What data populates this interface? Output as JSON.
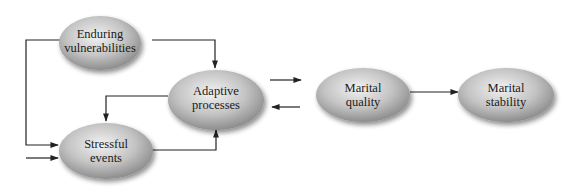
{
  "diagram": {
    "type": "flow-model",
    "nodes": [
      {
        "id": "enduring",
        "lines": [
          "Enduring",
          "vulnerabilities"
        ]
      },
      {
        "id": "adaptive",
        "lines": [
          "Adaptive",
          "processes"
        ]
      },
      {
        "id": "stressful",
        "lines": [
          "Stressful",
          "events"
        ]
      },
      {
        "id": "quality",
        "lines": [
          "Marital",
          "quality"
        ]
      },
      {
        "id": "stability",
        "lines": [
          "Marital",
          "stability"
        ]
      }
    ],
    "edges": [
      {
        "from": "enduring",
        "to": "adaptive"
      },
      {
        "from": "enduring",
        "to": "stressful"
      },
      {
        "from": "external",
        "to": "stressful"
      },
      {
        "from": "adaptive",
        "to": "stressful"
      },
      {
        "from": "stressful",
        "to": "adaptive"
      },
      {
        "from": "adaptive",
        "to": "quality"
      },
      {
        "from": "quality",
        "to": "adaptive"
      },
      {
        "from": "quality",
        "to": "stability"
      }
    ],
    "colors": {
      "node_light": "#ececec",
      "node_dark": "#8e8e8e",
      "edge": "#222222"
    }
  }
}
